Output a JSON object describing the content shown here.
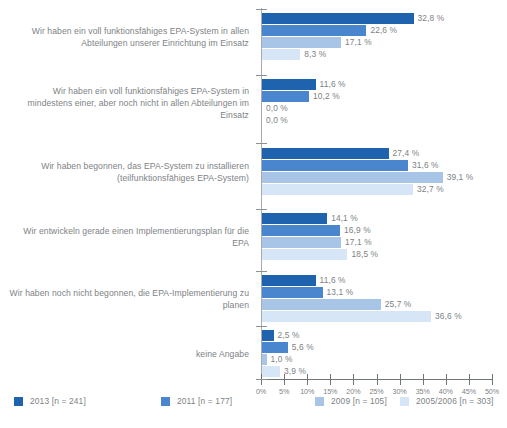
{
  "chart_data": {
    "type": "bar",
    "orientation": "horizontal",
    "title": "",
    "subtitle": "",
    "xlabel": "",
    "ylabel": "",
    "xlim": [
      0,
      50
    ],
    "xunit": "%",
    "grid": false,
    "legend_position": "bottom",
    "xticks": [
      "0%",
      "5%",
      "10%",
      "15%",
      "20%",
      "25%",
      "30%",
      "35%",
      "40%",
      "45%",
      "50%"
    ],
    "xtick_values": [
      0,
      5,
      10,
      15,
      20,
      25,
      30,
      35,
      40,
      45,
      50
    ],
    "categories": [
      "Wir haben ein voll funktionsfähiges EPA-System in allen Abteilungen unserer Einrichtung im Einsatz",
      "Wir haben ein voll funktionsfähiges EPA-System in mindestens einer, aber noch nicht in allen Abteilungen im Einsatz",
      "Wir haben begonnen, das EPA-System zu installieren (teilfunktionsfähiges EPA-System)",
      "Wir entwickeln gerade einen Implementierungsplan für die EPA",
      "Wir haben noch nicht begonnen, die EPA-Implementierung zu planen",
      "keine Angabe"
    ],
    "series": [
      {
        "name": "2013 [n = 241]",
        "color": "#1f63ae",
        "values": [
          32.8,
          11.6,
          27.4,
          14.1,
          11.6,
          2.5
        ],
        "labels": [
          "32,8 %",
          "11,6 %",
          "27,4 %",
          "14,1 %",
          "11,6 %",
          "2,5 %"
        ]
      },
      {
        "name": "2011 [n = 177]",
        "color": "#4a86cd",
        "values": [
          22.6,
          10.2,
          31.6,
          16.9,
          13.1,
          5.6
        ],
        "labels": [
          "22,6 %",
          "10,2 %",
          "31,6 %",
          "16,9 %",
          "13,1 %",
          "5,6 %"
        ]
      },
      {
        "name": "2009 [n = 105]",
        "color": "#a8c5e8",
        "values": [
          17.1,
          0.0,
          39.1,
          17.1,
          25.7,
          1.0
        ],
        "labels": [
          "17,1 %",
          "0,0 %",
          "39,1 %",
          "17,1 %",
          "25,7 %",
          "1,0 %"
        ]
      },
      {
        "name": "2005/2006 [n = 303]",
        "color": "#d6e6f7",
        "values": [
          8.3,
          0.0,
          32.7,
          18.5,
          36.6,
          3.9
        ],
        "labels": [
          "8,3 %",
          "0,0 %",
          "32,7 %",
          "18,5 %",
          "36,6 %",
          "3,9 %"
        ]
      }
    ]
  },
  "legend": {
    "items": [
      {
        "label": "2013 [n = 241]",
        "color": "#1f63ae"
      },
      {
        "label": "2011 [n = 177]",
        "color": "#4a86cd"
      },
      {
        "label": "2009 [n = 105]",
        "color": "#a8c5e8"
      },
      {
        "label": "2005/2006 [n = 303]",
        "color": "#d6e6f7"
      }
    ]
  }
}
